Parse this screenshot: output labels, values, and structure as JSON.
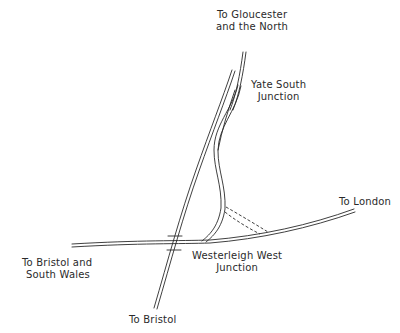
{
  "diagram": {
    "type": "railway-junction-sketch",
    "labels": {
      "north": {
        "line1": "To Gloucester",
        "line2": "and the North"
      },
      "yate": {
        "line1": "Yate South",
        "line2": "Junction"
      },
      "london": {
        "line1": "To London"
      },
      "bristol_wales": {
        "line1": "To Bristol and",
        "line2": "South Wales"
      },
      "westerleigh": {
        "line1": "Westerleigh West",
        "line2": "Junction"
      },
      "bristol": {
        "line1": "To Bristol"
      }
    },
    "colors": {
      "ink": "#2a2a2a",
      "background": "#ffffff"
    }
  }
}
